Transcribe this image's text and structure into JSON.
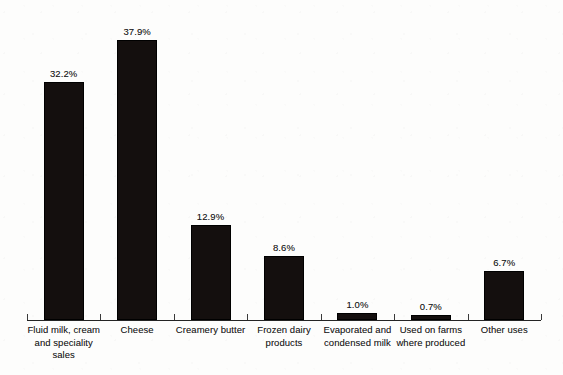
{
  "chart_data": {
    "type": "bar",
    "title": "",
    "subtitle": "",
    "xlabel": "",
    "ylabel": "",
    "ylim": [
      0,
      40
    ],
    "grid": false,
    "legend": false,
    "orientation": "vertical",
    "bar_color": "#140f0e",
    "background_color": "#fdfdfc",
    "axis_color": "#242424",
    "value_label_suffix": "%",
    "categories": [
      "Fluid milk, cream and speciality sales",
      "Cheese",
      "Creamery butter",
      "Frozen dairy products",
      "Evaporated and condensed milk",
      "Used on farms where produced",
      "Other uses"
    ],
    "values": [
      32.2,
      37.9,
      12.9,
      8.6,
      1.0,
      0.7,
      6.7
    ],
    "bars": [
      {
        "category": "Fluid milk, cream and speciality sales",
        "label_lines": [
          "Fluid milk, cream",
          "and speciality",
          "sales"
        ],
        "value": 32.2,
        "value_label": "32.2%"
      },
      {
        "category": "Cheese",
        "label_lines": [
          "Cheese"
        ],
        "value": 37.9,
        "value_label": "37.9%"
      },
      {
        "category": "Creamery butter",
        "label_lines": [
          "Creamery butter"
        ],
        "value": 12.9,
        "value_label": "12.9%"
      },
      {
        "category": "Frozen dairy products",
        "label_lines": [
          "Frozen dairy",
          "products"
        ],
        "value": 8.6,
        "value_label": "8.6%"
      },
      {
        "category": "Evaporated and condensed milk",
        "label_lines": [
          "Evaporated and",
          "condensed milk"
        ],
        "value": 1.0,
        "value_label": "1.0%"
      },
      {
        "category": "Used on farms where produced",
        "label_lines": [
          "Used on farms",
          "where produced"
        ],
        "value": 0.7,
        "value_label": "0.7%"
      },
      {
        "category": "Other uses",
        "label_lines": [
          "Other uses"
        ],
        "value": 6.7,
        "value_label": "6.7%"
      }
    ]
  }
}
